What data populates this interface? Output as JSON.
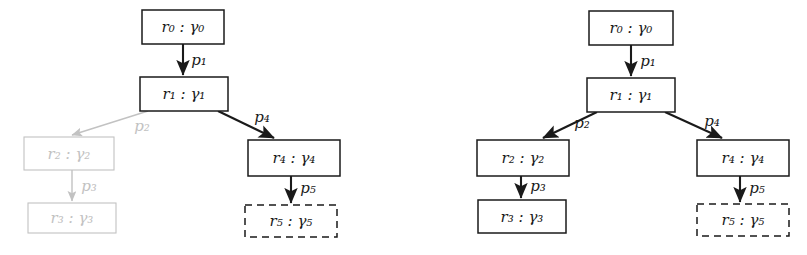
{
  "figure": {
    "background_color": "#ffffff",
    "active_color": "#1a1a1a",
    "faded_color": "#c2c2c2",
    "panels": [
      {
        "id": "left-panel",
        "name": "partial-rollout-tree",
        "nodes": [
          {
            "id": "r0",
            "label": "r₀ : γ₀",
            "state": "active",
            "border": "solid",
            "x": 142,
            "y": 10,
            "w": 82,
            "h": 34
          },
          {
            "id": "r1",
            "label": "r₁ : γ₁",
            "state": "active",
            "border": "solid",
            "x": 140,
            "y": 77,
            "w": 88,
            "h": 34
          },
          {
            "id": "r2",
            "label": "r₂ : γ₂",
            "state": "faded",
            "border": "solid",
            "x": 24,
            "y": 137,
            "w": 90,
            "h": 33
          },
          {
            "id": "r3",
            "label": "r₃ : γ₃",
            "state": "faded",
            "border": "solid",
            "x": 28,
            "y": 203,
            "w": 88,
            "h": 30
          },
          {
            "id": "r4",
            "label": "r₄ : γ₄",
            "state": "active",
            "border": "solid",
            "x": 248,
            "y": 140,
            "w": 92,
            "h": 36
          },
          {
            "id": "r5",
            "label": "r₅ : γ₅",
            "state": "active",
            "border": "dashed",
            "x": 245,
            "y": 205,
            "w": 92,
            "h": 32
          }
        ],
        "edges": [
          {
            "id": "e1",
            "label": "p₁",
            "from": "r0",
            "to": "r1",
            "state": "active",
            "x1": 183,
            "y1": 44,
            "x2": 183,
            "y2": 75,
            "lx": 199,
            "ly": 61
          },
          {
            "id": "e2",
            "label": "p₂",
            "from": "r1",
            "to": "r2",
            "state": "faded",
            "x1": 148,
            "y1": 111,
            "x2": 72,
            "y2": 135,
            "lx": 142,
            "ly": 127
          },
          {
            "id": "e4",
            "label": "p₄",
            "from": "r1",
            "to": "r4",
            "state": "active",
            "x1": 218,
            "y1": 111,
            "x2": 274,
            "y2": 138,
            "lx": 262,
            "ly": 118
          },
          {
            "id": "e3",
            "label": "p₃",
            "from": "r2",
            "to": "r3",
            "state": "faded",
            "x1": 72,
            "y1": 170,
            "x2": 72,
            "y2": 201,
            "lx": 89,
            "ly": 187
          },
          {
            "id": "e5",
            "label": "p₅",
            "from": "r4",
            "to": "r5",
            "state": "active",
            "x1": 291,
            "y1": 176,
            "x2": 291,
            "y2": 203,
            "lx": 308,
            "ly": 189
          }
        ]
      },
      {
        "id": "right-panel",
        "name": "full-rollout-tree",
        "nodes": [
          {
            "id": "r0",
            "label": "r₀ : γ₀",
            "state": "active",
            "border": "solid",
            "x": 589,
            "y": 11,
            "w": 84,
            "h": 34
          },
          {
            "id": "r1",
            "label": "r₁ : γ₁",
            "state": "active",
            "border": "solid",
            "x": 587,
            "y": 78,
            "w": 88,
            "h": 34
          },
          {
            "id": "r2",
            "label": "r₂ : γ₂",
            "state": "active",
            "border": "solid",
            "x": 477,
            "y": 140,
            "w": 92,
            "h": 36
          },
          {
            "id": "r3",
            "label": "r₃ : γ₃",
            "state": "active",
            "border": "solid",
            "x": 478,
            "y": 200,
            "w": 88,
            "h": 33
          },
          {
            "id": "r4",
            "label": "r₄ : γ₄",
            "state": "active",
            "border": "solid",
            "x": 697,
            "y": 140,
            "w": 92,
            "h": 36
          },
          {
            "id": "r5",
            "label": "r₅ : γ₅",
            "state": "active",
            "border": "dashed",
            "x": 697,
            "y": 204,
            "w": 92,
            "h": 32
          }
        ],
        "edges": [
          {
            "id": "e1",
            "label": "p₁",
            "from": "r0",
            "to": "r1",
            "state": "active",
            "x1": 631,
            "y1": 45,
            "x2": 631,
            "y2": 76,
            "lx": 648,
            "ly": 62
          },
          {
            "id": "e2",
            "label": "p₂",
            "from": "r1",
            "to": "r2",
            "state": "active",
            "x1": 597,
            "y1": 112,
            "x2": 543,
            "y2": 138,
            "lx": 582,
            "ly": 124
          },
          {
            "id": "e4",
            "label": "p₄",
            "from": "r1",
            "to": "r4",
            "state": "active",
            "x1": 665,
            "y1": 112,
            "x2": 722,
            "y2": 138,
            "lx": 712,
            "ly": 122
          },
          {
            "id": "e3",
            "label": "p₃",
            "from": "r2",
            "to": "r3",
            "state": "active",
            "x1": 521,
            "y1": 176,
            "x2": 521,
            "y2": 198,
            "lx": 538,
            "ly": 187
          },
          {
            "id": "e5",
            "label": "p₅",
            "from": "r4",
            "to": "r5",
            "state": "active",
            "x1": 740,
            "y1": 176,
            "x2": 740,
            "y2": 202,
            "lx": 757,
            "ly": 189
          }
        ]
      }
    ]
  }
}
